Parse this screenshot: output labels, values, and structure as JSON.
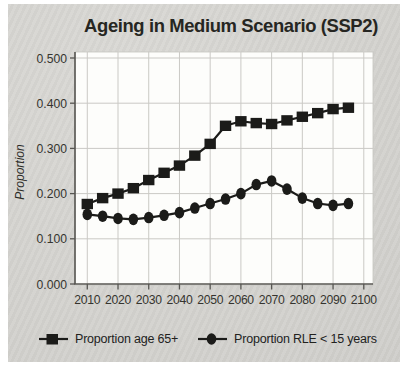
{
  "figure": {
    "panel_bg": "#d6d5d1",
    "plot_bg": "#fdfdfb"
  },
  "chart_data": {
    "type": "line",
    "title": "Ageing in Medium Scenario (SSP2)",
    "xlabel": "",
    "ylabel": "Proportion",
    "x": [
      2010,
      2015,
      2020,
      2025,
      2030,
      2035,
      2040,
      2045,
      2050,
      2055,
      2060,
      2065,
      2070,
      2075,
      2080,
      2085,
      2090,
      2095
    ],
    "series": [
      {
        "name": "Proportion age 65+",
        "marker": "square",
        "values": [
          0.177,
          0.19,
          0.2,
          0.212,
          0.23,
          0.246,
          0.262,
          0.284,
          0.31,
          0.35,
          0.36,
          0.356,
          0.354,
          0.362,
          0.37,
          0.378,
          0.387,
          0.39
        ]
      },
      {
        "name": "Proportion RLE < 15 years",
        "marker": "circle",
        "values": [
          0.154,
          0.15,
          0.145,
          0.143,
          0.147,
          0.152,
          0.158,
          0.168,
          0.178,
          0.188,
          0.2,
          0.22,
          0.228,
          0.21,
          0.19,
          0.178,
          0.174,
          0.178
        ]
      }
    ],
    "xticks": [
      2010,
      2020,
      2030,
      2040,
      2050,
      2060,
      2070,
      2080,
      2090,
      2100
    ],
    "yticks": [
      0,
      0.1,
      0.2,
      0.3,
      0.4,
      0.5
    ],
    "ytick_labels": [
      "0.000",
      "0.100",
      "0.200",
      "0.300",
      "0.400",
      "0.500"
    ],
    "xlim": [
      2006,
      2103
    ],
    "ylim": [
      0,
      0.5
    ],
    "grid": true,
    "legend_position": "bottom",
    "colors": {
      "line": "#1b1b19",
      "grid": "#cac9c5",
      "axis": "#575652",
      "tick_text": "#35342f"
    }
  }
}
